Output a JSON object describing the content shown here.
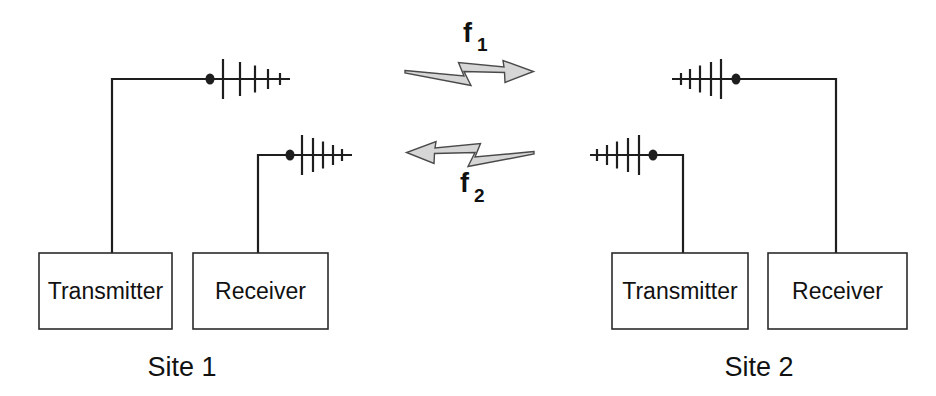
{
  "colors": {
    "background": "#ffffff",
    "line": "#1e1e1e",
    "text": "#111111",
    "arrow_fill": "#d6d6d6",
    "arrow_outline": "#4a4a4a"
  },
  "link": {
    "f1_base": "f",
    "f1_sub": "1",
    "f2_base": "f",
    "f2_sub": "2"
  },
  "site1": {
    "name": "Site 1",
    "transmitter": "Transmitter",
    "receiver": "Receiver"
  },
  "site2": {
    "name": "Site 2",
    "transmitter": "Transmitter",
    "receiver": "Receiver"
  }
}
